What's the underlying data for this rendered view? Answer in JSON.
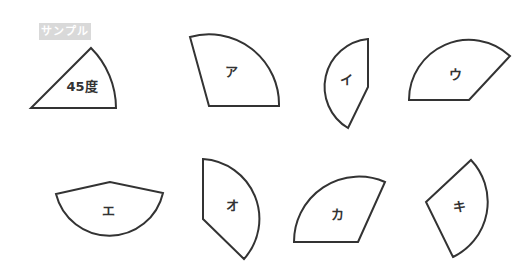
{
  "badge": {
    "label": "サンプル",
    "color": "#d9d9d9"
  },
  "sample": {
    "label": "45度"
  },
  "shapes": [
    {
      "id": "a",
      "label": "ア"
    },
    {
      "id": "i",
      "label": "イ"
    },
    {
      "id": "u",
      "label": "ウ"
    },
    {
      "id": "e",
      "label": "エ"
    },
    {
      "id": "o",
      "label": "オ"
    },
    {
      "id": "ka",
      "label": "カ"
    },
    {
      "id": "ki",
      "label": "キ"
    }
  ],
  "stroke_color": "#333333"
}
